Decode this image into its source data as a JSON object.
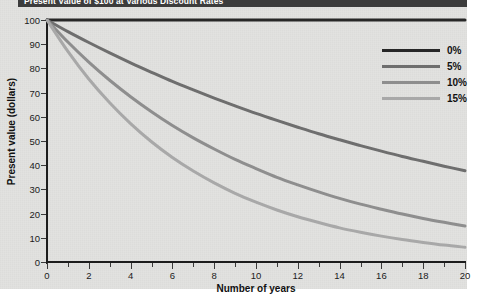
{
  "header": {
    "title": "Present Value of $100 at Various Discount Rates"
  },
  "chart_data": {
    "type": "line",
    "title": "Present Value of $100 at Various Discount Rates",
    "xlabel": "Number of years",
    "ylabel": "Present value (dollars)",
    "xlim": [
      0,
      20
    ],
    "ylim": [
      0,
      100
    ],
    "grid": false,
    "legend_position": "upper right",
    "x": [
      0,
      1,
      2,
      3,
      4,
      5,
      6,
      7,
      8,
      9,
      10,
      11,
      12,
      13,
      14,
      15,
      16,
      17,
      18,
      19,
      20
    ],
    "xticks": [
      0,
      2,
      4,
      6,
      8,
      10,
      12,
      14,
      16,
      18,
      20
    ],
    "xtick_labels": [
      "0",
      "2",
      "4",
      "6",
      "8",
      "10",
      "12",
      "14",
      "16",
      "18",
      "20"
    ],
    "yticks": [
      0,
      10,
      20,
      30,
      40,
      50,
      60,
      70,
      80,
      90,
      100
    ],
    "ytick_labels": [
      "0",
      "10",
      "20",
      "30",
      "40",
      "50",
      "60",
      "70",
      "80",
      "90",
      "100"
    ],
    "series": [
      {
        "name": "0%",
        "rate": 0.0,
        "color": "#272727",
        "values": [
          100,
          100,
          100,
          100,
          100,
          100,
          100,
          100,
          100,
          100,
          100,
          100,
          100,
          100,
          100,
          100,
          100,
          100,
          100,
          100,
          100
        ]
      },
      {
        "name": "5%",
        "rate": 0.05,
        "color": "#6e6e6e",
        "values": [
          100,
          95.2,
          90.7,
          86.4,
          82.3,
          78.4,
          74.6,
          71.1,
          67.7,
          64.5,
          61.4,
          58.5,
          55.7,
          53.0,
          50.5,
          48.1,
          45.8,
          43.6,
          41.6,
          39.6,
          37.7
        ]
      },
      {
        "name": "10%",
        "rate": 0.1,
        "color": "#8e8e8e",
        "values": [
          100,
          90.9,
          82.6,
          75.1,
          68.3,
          62.1,
          56.4,
          51.3,
          46.7,
          42.4,
          38.6,
          35.0,
          31.9,
          29.0,
          26.3,
          23.9,
          21.8,
          19.8,
          18.0,
          16.4,
          14.9
        ]
      },
      {
        "name": "15%",
        "rate": 0.15,
        "color": "#a8a8a8",
        "values": [
          100,
          87.0,
          75.6,
          65.8,
          57.2,
          49.7,
          43.2,
          37.6,
          32.7,
          28.4,
          24.7,
          21.5,
          18.7,
          16.3,
          14.1,
          12.3,
          10.7,
          9.3,
          8.1,
          7.0,
          6.1
        ]
      }
    ]
  }
}
